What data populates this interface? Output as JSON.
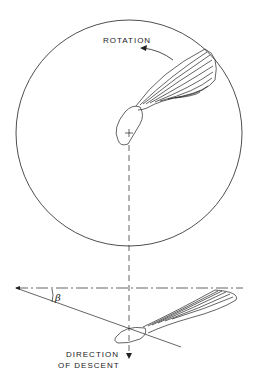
{
  "figure": {
    "labels": {
      "rotation": "ROTATION",
      "angle": "β",
      "descent_line1": "DIRECTION",
      "descent_line2": "OF DESCENT"
    },
    "colors": {
      "stroke": "#222222",
      "background": "#ffffff"
    },
    "elements": {
      "top_view": "circle of rotation with winged seed (samara) viewed from above",
      "side_view": "samara viewed from side, tilted at angle beta to horizontal"
    }
  }
}
